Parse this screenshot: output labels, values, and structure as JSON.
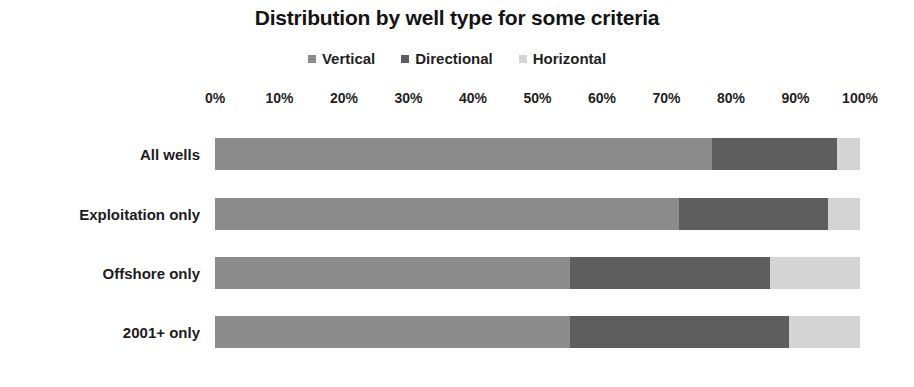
{
  "chart_data": {
    "type": "bar",
    "subtype": "stacked-horizontal-100pct",
    "title": "Distribution by well type for some criteria",
    "xlabel": "",
    "ylabel": "",
    "categories": [
      "All wells",
      "Exploitation only",
      "Offshore only",
      "2001+ only"
    ],
    "series": [
      {
        "name": "Vertical",
        "color": "#8c8c8c",
        "values": [
          77,
          72,
          55,
          55
        ]
      },
      {
        "name": "Directional",
        "color": "#5e5e5e",
        "values": [
          19.5,
          23,
          31,
          34
        ]
      },
      {
        "name": "Horizontal",
        "color": "#d4d4d4",
        "values": [
          3.5,
          5,
          14,
          11
        ]
      }
    ],
    "xlim": [
      0,
      100
    ],
    "xticks": [
      0,
      10,
      20,
      30,
      40,
      50,
      60,
      70,
      80,
      90,
      100
    ],
    "xtick_labels": [
      "0%",
      "10%",
      "20%",
      "30%",
      "40%",
      "50%",
      "60%",
      "70%",
      "80%",
      "90%",
      "100%"
    ],
    "grid": false,
    "legend_position": "top-center",
    "legend_entries": [
      "Vertical",
      "Directional",
      "Horizontal"
    ]
  },
  "legend": {
    "items": [
      {
        "label": "Vertical",
        "swatch": "legend-swatch-vertical"
      },
      {
        "label": "Directional",
        "swatch": "legend-swatch-directional"
      },
      {
        "label": "Horizontal",
        "swatch": "legend-swatch-horizontal"
      }
    ]
  },
  "colors": {
    "vertical": "#8c8c8c",
    "directional": "#5e5e5e",
    "horizontal": "#d4d4d4",
    "background": "#ffffff",
    "text": "#1a1a1a"
  }
}
